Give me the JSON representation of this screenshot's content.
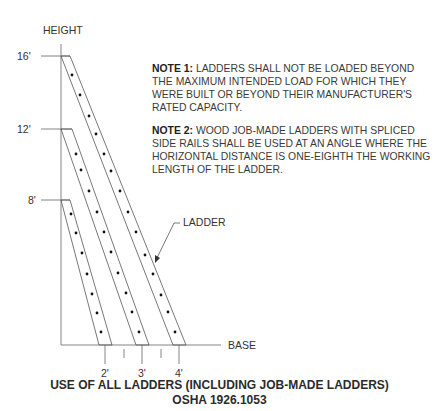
{
  "axes": {
    "y_label": "HEIGHT",
    "x_label": "BASE",
    "y_ticks": [
      "16'",
      "12'",
      "8'"
    ],
    "x_ticks": [
      "2'",
      "3'",
      "4'"
    ]
  },
  "callout": {
    "label": "LADDER"
  },
  "notes": [
    {
      "heading": "NOTE 1:",
      "text": " LADDERS SHALL NOT BE LOADED BEYOND THE MAXIMUM INTENDED LOAD FOR WHICH THEY WERE BUILT OR BEYOND THEIR MANUFACTURER'S RATED CAPACITY."
    },
    {
      "heading": "NOTE 2:",
      "text": " WOOD JOB-MADE LADDERS WITH SPLICED SIDE RAILS SHALL BE USED AT AN ANGLE WHERE THE HORIZONTAL DISTANCE IS ONE-EIGHTH THE WORKING LENGTH OF THE LADDER."
    }
  ],
  "caption": {
    "line1": "USE OF ALL LADDERS (INCLUDING JOB-MADE LADDERS)",
    "line2": "OSHA 1926.1053"
  },
  "ladders": [
    {
      "height": "16'",
      "base_offset": "4'",
      "rungs": 11
    },
    {
      "height": "12'",
      "base_offset": "3'",
      "rungs": 8
    },
    {
      "height": "8'",
      "base_offset": "2'",
      "rungs": 7
    }
  ],
  "colors": {
    "line": "#555555",
    "text": "#333333",
    "dot": "#111111"
  }
}
